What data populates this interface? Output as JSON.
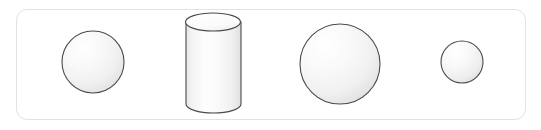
{
  "scene": {
    "title": "3D solid shapes row",
    "background_color": "#ffffff",
    "panel": {
      "label": "shapes-panel",
      "x": 16,
      "y": 9,
      "width": 510,
      "height": 111,
      "corner_radius": 11,
      "border_color": "#e2e2e2",
      "fill_color": "#ffffff"
    },
    "shape_count": 4,
    "stroke_color": "#4a4a4a",
    "fill_light": "#ffffff",
    "fill_mid": "#f2f2f2",
    "fill_shadow": "#dcdcdc"
  },
  "shapes": [
    {
      "name": "sphere-small-left",
      "type": "sphere",
      "order": 1,
      "center_x": 93,
      "center_y": 62,
      "radius": 31,
      "diameter": 62,
      "highlight_x": 80,
      "highlight_y": 47
    },
    {
      "name": "cylinder",
      "type": "cylinder",
      "order": 2,
      "center_x": 213,
      "top_y": 22,
      "bottom_y": 104,
      "width": 55,
      "height": 82,
      "ellipse_ry": 9,
      "left_x": 186,
      "right_x": 241
    },
    {
      "name": "sphere-large",
      "type": "sphere",
      "order": 3,
      "center_x": 340,
      "center_y": 64,
      "radius": 40,
      "diameter": 80,
      "highlight_x": 323,
      "highlight_y": 45
    },
    {
      "name": "sphere-smallest-right",
      "type": "sphere",
      "order": 4,
      "center_x": 462,
      "center_y": 62,
      "radius": 21,
      "diameter": 42,
      "highlight_x": 453,
      "highlight_y": 52
    }
  ]
}
